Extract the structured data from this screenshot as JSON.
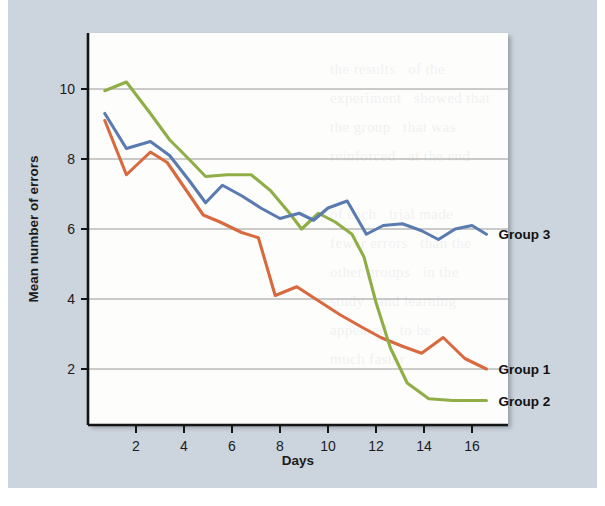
{
  "figure": {
    "background_color": "#ccd4dd",
    "plot_background_color": "#fdfdfc",
    "ghost_text": "the results   of the\nexperiment   showed that\nthe group   that was\nreinforced   at the end\n\nof each   trial made\nfewer errors   than the\nother groups   in the\nstudy   and learning\nappeared   to be\nmuch faster"
  },
  "chart_data": {
    "type": "line",
    "title": "",
    "xlabel": "Days",
    "ylabel": "Mean number of errors",
    "xlim": [
      0,
      17.5
    ],
    "ylim": [
      0.4,
      11.6
    ],
    "xticks": [
      2,
      4,
      6,
      8,
      10,
      12,
      14,
      16
    ],
    "yticks": [
      2,
      4,
      6,
      8,
      10
    ],
    "grid": "horizontal",
    "legend_position": "right-inline-end-of-line",
    "series": [
      {
        "name": "Group 1",
        "color": "#d9693f",
        "label_y_value": 2.0,
        "x": [
          0.7,
          1.6,
          2.6,
          3.3,
          4.1,
          4.8,
          5.5,
          6.4,
          7.1,
          7.8,
          8.7,
          9.6,
          10.5,
          11.4,
          12.2,
          13.1,
          13.9,
          14.8,
          15.7,
          16.6
        ],
        "y": [
          9.1,
          7.55,
          8.2,
          7.9,
          7.1,
          6.4,
          6.2,
          5.9,
          5.75,
          4.1,
          4.35,
          3.95,
          3.55,
          3.2,
          2.9,
          2.65,
          2.45,
          2.9,
          2.3,
          2.0
        ]
      },
      {
        "name": "Group 2",
        "color": "#8fae46",
        "label_y_value": 1.1,
        "x": [
          0.7,
          1.6,
          2.6,
          3.4,
          4.2,
          4.9,
          5.8,
          6.8,
          7.6,
          8.4,
          8.9,
          9.6,
          10.3,
          11.0,
          11.5,
          12.0,
          12.6,
          13.3,
          14.2,
          15.2,
          16.6
        ],
        "y": [
          9.95,
          10.2,
          9.3,
          8.55,
          8.0,
          7.5,
          7.55,
          7.55,
          7.1,
          6.45,
          6.0,
          6.45,
          6.2,
          5.85,
          5.2,
          3.9,
          2.6,
          1.6,
          1.15,
          1.1,
          1.1
        ]
      },
      {
        "name": "Group 3",
        "color": "#5a7bb0",
        "label_y_value": 5.85,
        "x": [
          0.7,
          1.6,
          2.6,
          3.4,
          4.2,
          4.9,
          5.6,
          6.4,
          7.2,
          8.0,
          8.8,
          9.4,
          10.0,
          10.8,
          11.6,
          12.3,
          13.1,
          13.9,
          14.6,
          15.3,
          16.0,
          16.6
        ],
        "y": [
          9.3,
          8.3,
          8.5,
          8.1,
          7.4,
          6.75,
          7.25,
          6.95,
          6.6,
          6.3,
          6.45,
          6.25,
          6.6,
          6.8,
          5.85,
          6.1,
          6.15,
          5.95,
          5.7,
          6.0,
          6.1,
          5.85
        ]
      }
    ]
  },
  "axes": {
    "y_title": "Mean number of errors",
    "x_title": "Days",
    "x_tick_labels": [
      "2",
      "4",
      "6",
      "8",
      "10",
      "12",
      "14",
      "16"
    ],
    "y_tick_labels": [
      "2",
      "4",
      "6",
      "8",
      "10"
    ]
  },
  "legend": {
    "items": [
      {
        "label": "Group 3",
        "color": "#5a7bb0"
      },
      {
        "label": "Group 1",
        "color": "#d9693f"
      },
      {
        "label": "Group 2",
        "color": "#8fae46"
      }
    ]
  }
}
